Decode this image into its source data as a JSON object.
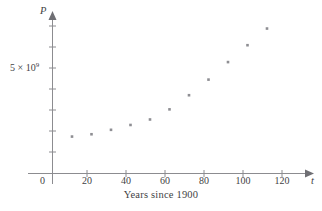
{
  "figure": {
    "caption": "Years since 1900",
    "y_axis_name": "P",
    "x_axis_name": "t",
    "origin_label": "0",
    "y_tick_label_text": "5 × 10",
    "y_tick_label_exponent": "9",
    "point_color": "#8e8e93",
    "axis_color": "#8c8c90",
    "text_color": "#3f3f44",
    "background_color": "#ffffff"
  },
  "chart_data": {
    "type": "scatter",
    "title": "",
    "subtitle": "",
    "xlabel": "Years since 1900",
    "ylabel": "P",
    "x_axis_symbol": "t",
    "y_axis_symbol": "P",
    "xlim": [
      0,
      130
    ],
    "ylim": [
      0,
      8000000000
    ],
    "grid": false,
    "legend": null,
    "xticks": [
      0,
      20,
      40,
      60,
      80,
      100,
      120
    ],
    "xtick_labels": [
      "0",
      "20",
      "40",
      "60",
      "80",
      "100",
      "120"
    ],
    "yticks": [
      1000000000,
      2000000000,
      3000000000,
      4000000000,
      5000000000,
      6000000000,
      7000000000
    ],
    "ytick_labels": [
      "",
      "",
      "",
      "",
      "5 × 10^9",
      "",
      ""
    ],
    "y_labeled_tick_value": 5000000000,
    "y_labeled_tick_text": "5 × 10⁹",
    "x": [
      10,
      20,
      30,
      40,
      50,
      60,
      70,
      80,
      90,
      100,
      110
    ],
    "y": [
      1750000000,
      1860000000,
      2070000000,
      2300000000,
      2560000000,
      3040000000,
      3710000000,
      4450000000,
      5280000000,
      6080000000,
      6870000000
    ],
    "series": [
      {
        "name": "World population",
        "x": [
          10,
          20,
          30,
          40,
          50,
          60,
          70,
          80,
          90,
          100,
          110
        ],
        "values": [
          1750000000,
          1860000000,
          2070000000,
          2300000000,
          2560000000,
          3040000000,
          3710000000,
          4450000000,
          5280000000,
          6080000000,
          6870000000
        ]
      }
    ],
    "annotations": []
  }
}
